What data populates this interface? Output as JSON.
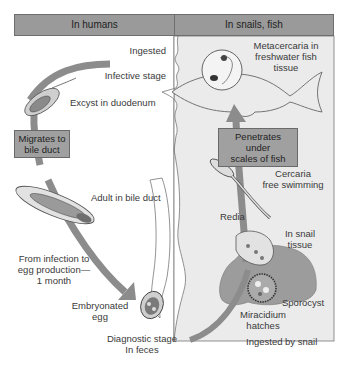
{
  "headers": {
    "left": "In humans",
    "right": "In snails, fish"
  },
  "labels": {
    "ingested": "Ingested",
    "infective_stage": "Infective stage",
    "excyst": "Excyst in duodenum",
    "adult": "Adult in bile duct",
    "from_infection": [
      "From infection to",
      "egg production—",
      "1 month"
    ],
    "embryonated_egg": [
      "Embryonated",
      "egg"
    ],
    "diagnostic_stage": [
      "Diagnostic stage",
      "In feces"
    ],
    "metacercaria": [
      "Metacercaria in",
      "freshwater fish",
      "tissue"
    ],
    "cercaria": [
      "Cercaria",
      "free swimming"
    ],
    "redia": "Redia",
    "in_snail_tissue": [
      "In snail",
      "tissue"
    ],
    "sporocyst": "Sporocyst",
    "miracidium": [
      "Miracidium",
      "hatches"
    ],
    "ingested_by_snail": "Ingested by snail"
  },
  "boxes": {
    "migrates": [
      "Migrates to",
      "bile duct"
    ],
    "penetrates": [
      "Penetrates under",
      "scales of fish"
    ]
  },
  "colors": {
    "header_bg": "#9a9a9a",
    "panel_right_bg": "#ebebeb",
    "arrow": "#8c8c8c",
    "snail": "#9c9c9c",
    "box_bg": "#a0a0a0"
  }
}
